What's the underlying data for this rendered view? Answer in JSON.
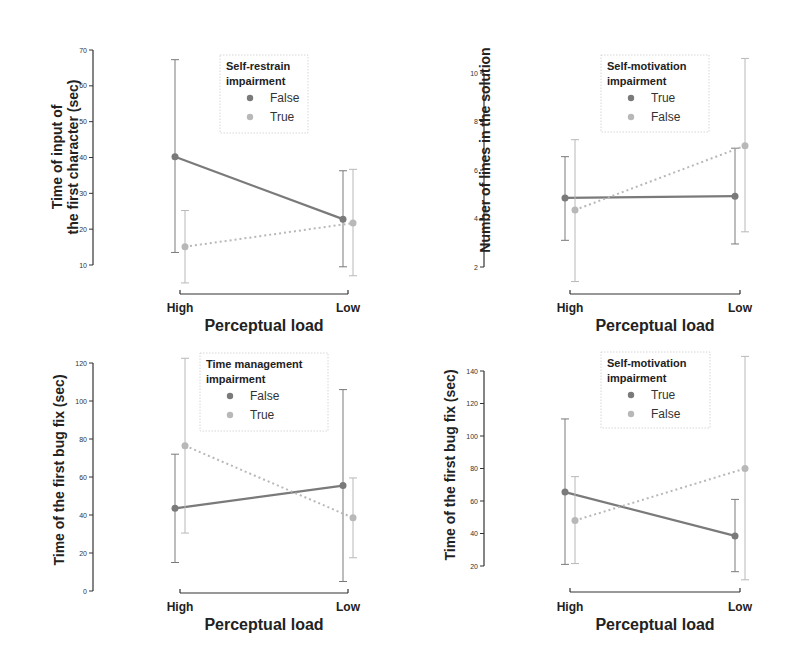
{
  "figure": {
    "colors": {
      "dark": "#7a7a7a",
      "light": "#b8b8b8",
      "axis": "#333333",
      "legend_border": "#cccccc"
    }
  },
  "chart_data": [
    {
      "type": "line",
      "title": "",
      "xlabel": "Perceptual load",
      "ylabel_lines": [
        "Time of input of",
        "the first character (sec)"
      ],
      "categories": [
        "High",
        "Low"
      ],
      "yticks": [
        10,
        20,
        30,
        40,
        50,
        60,
        70
      ],
      "ylim": [
        10,
        70
      ],
      "legend": {
        "title_lines": [
          "Self-restrain",
          "impairment"
        ],
        "position": "top-center"
      },
      "series": [
        {
          "name": "False",
          "style": "solid",
          "color": "dark",
          "values": [
            40.2,
            22.8
          ],
          "ci_low": [
            13.5,
            9.5
          ],
          "ci_high": [
            67.3,
            36.3
          ]
        },
        {
          "name": "True",
          "style": "dotted",
          "color": "light",
          "values": [
            15.1,
            21.7
          ],
          "ci_low": [
            5.0,
            7.0
          ],
          "ci_high": [
            25.2,
            36.7
          ]
        }
      ]
    },
    {
      "type": "line",
      "title": "",
      "xlabel": "Perceptual load",
      "ylabel_lines": [
        "Number of lines in the solution"
      ],
      "categories": [
        "High",
        "Low"
      ],
      "yticks": [
        2,
        4,
        6,
        8,
        10
      ],
      "ylim": [
        2,
        10
      ],
      "legend": {
        "title_lines": [
          "Self-motivation",
          "impairment"
        ],
        "position": "top-center"
      },
      "series": [
        {
          "name": "True",
          "style": "solid",
          "color": "dark",
          "values": [
            4.85,
            4.92
          ],
          "ci_low": [
            3.1,
            2.95
          ],
          "ci_high": [
            6.55,
            6.9
          ]
        },
        {
          "name": "False",
          "style": "dotted",
          "color": "light",
          "values": [
            4.35,
            7.0
          ],
          "ci_low": [
            1.4,
            3.45
          ],
          "ci_high": [
            7.25,
            10.6
          ]
        }
      ]
    },
    {
      "type": "line",
      "title": "",
      "xlabel": "Perceptual load",
      "ylabel_lines": [
        "Time of the first bug fix (sec)"
      ],
      "categories": [
        "High",
        "Low"
      ],
      "yticks": [
        0,
        20,
        40,
        60,
        80,
        100,
        120
      ],
      "ylim": [
        0,
        120
      ],
      "legend": {
        "title_lines": [
          "Time management",
          "impairment"
        ],
        "position": "top-center"
      },
      "series": [
        {
          "name": "False",
          "style": "solid",
          "color": "dark",
          "values": [
            43.5,
            55.5
          ],
          "ci_low": [
            15.0,
            5.0
          ],
          "ci_high": [
            72.0,
            106.0
          ]
        },
        {
          "name": "True",
          "style": "dotted",
          "color": "light",
          "values": [
            76.5,
            38.5
          ],
          "ci_low": [
            30.5,
            17.5
          ],
          "ci_high": [
            122.5,
            59.5
          ]
        }
      ]
    },
    {
      "type": "line",
      "title": "",
      "xlabel": "Perceptual load",
      "ylabel_lines": [
        "Time of the first bug fix (sec)"
      ],
      "categories": [
        "High",
        "Low"
      ],
      "yticks": [
        20,
        40,
        60,
        80,
        100,
        120,
        140
      ],
      "ylim": [
        20,
        140
      ],
      "legend": {
        "title_lines": [
          "Self-motivation",
          "impairment"
        ],
        "position": "top-center"
      },
      "series": [
        {
          "name": "True",
          "style": "solid",
          "color": "dark",
          "values": [
            65.5,
            38.5
          ],
          "ci_low": [
            21.0,
            16.5
          ],
          "ci_high": [
            110.5,
            61.0
          ]
        },
        {
          "name": "False",
          "style": "dotted",
          "color": "light",
          "values": [
            48.0,
            80.0
          ],
          "ci_low": [
            21.5,
            11.5
          ],
          "ci_high": [
            75.0,
            149.0
          ]
        }
      ]
    }
  ]
}
